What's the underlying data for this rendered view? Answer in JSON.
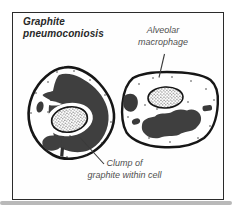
{
  "figure": {
    "title": "Graphite\npneumoconiosis",
    "annotations": {
      "macrophage_label": "Alveolar\nmacrophage",
      "clump_label": "Clump of\ngraphite within cell"
    },
    "illustration": {
      "parts": [
        "alveolar-macrophage-cell-left",
        "alveolar-macrophage-cell-right",
        "cell-nucleus-stippled",
        "graphite-clump",
        "macrophage-pointer-line",
        "clump-pointer-line"
      ]
    },
    "colors": {
      "background": "#ffffff",
      "frame_border": "#2b2b2b",
      "ink_outline": "#161616",
      "graphite_fill": "#3f3f3f",
      "title_text": "#282828",
      "annotation_text": "#505050",
      "shadow_band": "#b9b9b9"
    }
  }
}
